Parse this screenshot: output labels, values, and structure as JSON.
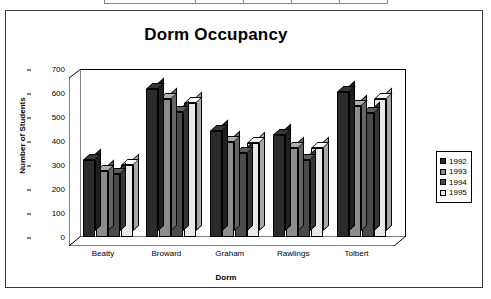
{
  "chart_data": {
    "type": "bar",
    "title": "Dorm Occupancy",
    "xlabel": "Dorm",
    "ylabel": "Number of Students",
    "categories": [
      "Beatty",
      "Broward",
      "Graham",
      "Rawlings",
      "Tolbert"
    ],
    "series": [
      {
        "name": "1992",
        "color": "#2b2b2b",
        "values": [
          320,
          615,
          440,
          425,
          605
        ]
      },
      {
        "name": "1993",
        "color": "#8c8c8c",
        "values": [
          275,
          575,
          395,
          370,
          545
        ]
      },
      {
        "name": "1994",
        "color": "#4a4a4a",
        "values": [
          262,
          520,
          350,
          320,
          515
        ]
      },
      {
        "name": "1995",
        "color": "#e8e8e8",
        "values": [
          300,
          560,
          390,
          370,
          575
        ]
      }
    ],
    "ylim": [
      0,
      700
    ],
    "yticks": [
      0,
      100,
      200,
      300,
      400,
      500,
      600,
      700
    ],
    "grid": false,
    "legend_position": "right",
    "style": "3d-column"
  },
  "frame": {
    "table_fragment_cells": [
      "",
      "",
      "",
      "",
      ""
    ]
  }
}
